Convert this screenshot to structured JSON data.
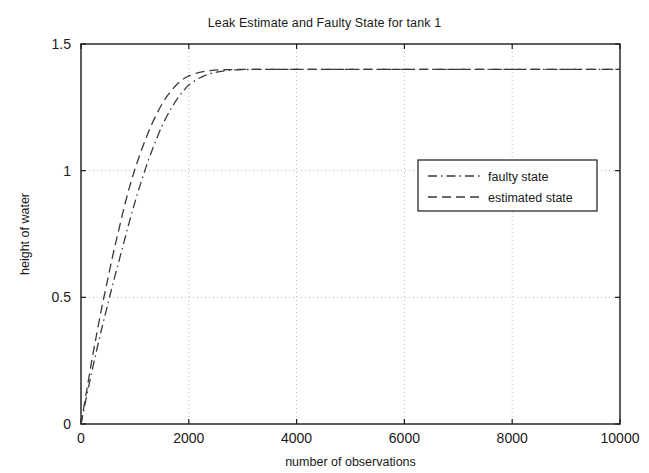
{
  "chart_data": {
    "type": "line",
    "title": "Leak Estimate and Faulty State for tank 1",
    "xlabel": "number of observations",
    "ylabel": "height of water",
    "xlim": [
      0,
      10000
    ],
    "ylim": [
      0,
      1.5
    ],
    "xticks": [
      0,
      2000,
      4000,
      6000,
      8000,
      10000
    ],
    "xticklabels": [
      "0",
      "2000",
      "4000",
      "6000",
      "8000",
      "10000"
    ],
    "yticks": [
      0,
      0.5,
      1,
      1.5
    ],
    "yticklabels": [
      "0",
      "0.5",
      "1",
      "1.5"
    ],
    "grid": true,
    "grid_style": "dotted",
    "grid_color": "#bdbdbd",
    "legend_position": "right-upper",
    "line_color": "#3a3a3a",
    "axes_color": "#1a1a1a",
    "background": "#ffffff",
    "series": [
      {
        "name": "faulty state",
        "dash": "dash-dot",
        "x": [
          0,
          100,
          200,
          300,
          400,
          500,
          600,
          700,
          800,
          900,
          1000,
          1100,
          1200,
          1300,
          1400,
          1500,
          1600,
          1700,
          1800,
          1900,
          2000,
          2200,
          2400,
          2600,
          2800,
          3000,
          3400,
          3800,
          4200,
          5000,
          6000,
          7000,
          8000,
          9000,
          10000
        ],
        "y": [
          0.0,
          0.105,
          0.205,
          0.3,
          0.39,
          0.475,
          0.56,
          0.64,
          0.72,
          0.8,
          0.875,
          0.945,
          1.01,
          1.07,
          1.125,
          1.175,
          1.218,
          1.255,
          1.288,
          1.315,
          1.338,
          1.366,
          1.383,
          1.392,
          1.397,
          1.399,
          1.4,
          1.4,
          1.4,
          1.4,
          1.4,
          1.4,
          1.4,
          1.4,
          1.4
        ]
      },
      {
        "name": "estimated state",
        "dash": "dashed",
        "x": [
          0,
          100,
          200,
          300,
          400,
          500,
          600,
          700,
          800,
          900,
          1000,
          1100,
          1200,
          1300,
          1400,
          1500,
          1600,
          1700,
          1800,
          1900,
          2000,
          2200,
          2400,
          2600,
          2800,
          3000,
          3400,
          3800,
          4200,
          5000,
          6000,
          7000,
          8000,
          9000,
          10000
        ],
        "y": [
          0.0,
          0.125,
          0.25,
          0.365,
          0.475,
          0.575,
          0.675,
          0.765,
          0.855,
          0.935,
          1.005,
          1.068,
          1.125,
          1.177,
          1.222,
          1.262,
          1.295,
          1.322,
          1.345,
          1.362,
          1.374,
          1.388,
          1.395,
          1.398,
          1.399,
          1.4,
          1.4,
          1.4,
          1.4,
          1.4,
          1.4,
          1.4,
          1.4,
          1.4,
          1.4
        ]
      }
    ],
    "legend": [
      {
        "label": "faulty state",
        "dash": "dash-dot"
      },
      {
        "label": "estimated state",
        "dash": "dashed"
      }
    ]
  }
}
